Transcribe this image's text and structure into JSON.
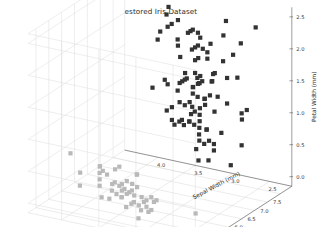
{
  "figure": {
    "title": "Restored Iris Dataset",
    "background_color": "#ffffff",
    "grid_color": "#d8d8d8",
    "axis_color": "#5a5a5a",
    "width": 317,
    "height": 227
  },
  "chart_data": {
    "type": "scatter",
    "projection": "3d",
    "title": "Restored Iris Dataset",
    "xlabel": "Sepal Length (mm)",
    "ylabel": "Sepal Width (mm)",
    "zlabel": "Petal Width (mm)",
    "xticks": [
      4.5,
      5.0,
      5.5,
      6.0,
      6.5,
      7.0,
      7.5
    ],
    "yticks": [
      2.5,
      3.0,
      3.5,
      4.0
    ],
    "zticks": [
      0.0,
      0.5,
      1.0,
      1.5,
      2.0,
      2.5
    ],
    "xlim": [
      4.2,
      7.95
    ],
    "ylim": [
      2.2,
      4.45
    ],
    "zlim": [
      -0.15,
      2.65
    ],
    "grid": true,
    "legend": null,
    "marker": "square",
    "marker_size": 2.1,
    "marker_color": "#333333",
    "x": [
      5.1,
      4.9,
      4.7,
      4.6,
      5.0,
      5.4,
      4.6,
      5.0,
      4.4,
      4.9,
      5.4,
      4.8,
      4.8,
      4.3,
      5.8,
      5.7,
      5.4,
      5.1,
      5.7,
      5.1,
      5.4,
      5.1,
      4.6,
      5.1,
      4.8,
      5.0,
      5.0,
      5.2,
      5.2,
      4.7,
      4.8,
      5.4,
      5.2,
      5.5,
      4.9,
      5.0,
      5.5,
      4.9,
      4.4,
      5.1,
      5.0,
      4.5,
      4.4,
      5.0,
      5.1,
      4.8,
      5.1,
      4.6,
      5.3,
      5.0,
      7.0,
      6.4,
      6.9,
      5.5,
      6.5,
      5.7,
      6.3,
      4.9,
      6.6,
      5.2,
      5.0,
      5.9,
      6.0,
      6.1,
      5.6,
      6.7,
      5.6,
      5.8,
      6.2,
      5.6,
      5.9,
      6.1,
      6.3,
      6.1,
      6.4,
      6.6,
      6.8,
      6.7,
      6.0,
      5.7,
      5.5,
      5.5,
      5.8,
      6.0,
      5.4,
      6.0,
      6.7,
      6.3,
      5.6,
      5.5,
      5.5,
      6.1,
      5.8,
      5.0,
      5.6,
      5.7,
      5.7,
      6.2,
      5.1,
      5.7,
      6.3,
      5.8,
      7.1,
      6.3,
      6.5,
      7.6,
      4.9,
      7.3,
      6.7,
      7.2,
      6.5,
      6.4,
      6.8,
      5.7,
      5.8,
      6.4,
      6.5,
      7.7,
      7.7,
      6.0,
      6.9,
      5.6,
      7.7,
      6.3,
      6.7,
      7.2,
      6.2,
      6.1,
      6.4,
      7.2,
      7.4,
      7.9,
      6.4,
      6.3,
      6.1,
      7.7,
      6.3,
      6.4,
      6.0,
      6.9,
      6.7,
      6.9,
      5.8,
      6.8,
      6.7,
      6.7,
      6.3,
      6.5,
      6.2,
      5.9
    ],
    "y": [
      3.5,
      3.0,
      3.2,
      3.1,
      3.6,
      3.9,
      3.4,
      3.4,
      2.9,
      3.1,
      3.7,
      3.4,
      3.0,
      3.0,
      4.0,
      4.4,
      3.9,
      3.5,
      3.8,
      3.8,
      3.4,
      3.7,
      3.6,
      3.3,
      3.4,
      3.0,
      3.4,
      3.5,
      3.4,
      3.2,
      3.1,
      3.4,
      4.1,
      4.2,
      3.1,
      3.2,
      3.5,
      3.6,
      3.0,
      3.4,
      3.5,
      2.3,
      3.2,
      3.5,
      3.8,
      3.0,
      3.8,
      3.2,
      3.7,
      3.3,
      3.2,
      3.2,
      3.1,
      2.3,
      2.8,
      2.8,
      3.3,
      2.4,
      2.9,
      2.7,
      2.0,
      3.0,
      2.2,
      2.9,
      2.9,
      3.1,
      3.0,
      2.7,
      2.2,
      2.5,
      3.2,
      2.8,
      2.5,
      2.8,
      2.9,
      3.0,
      2.8,
      3.0,
      2.9,
      2.6,
      2.4,
      2.4,
      2.7,
      2.7,
      3.0,
      3.4,
      3.1,
      2.3,
      3.0,
      2.5,
      2.6,
      3.0,
      2.6,
      2.3,
      2.7,
      3.0,
      2.9,
      2.9,
      2.5,
      2.8,
      3.3,
      2.7,
      3.0,
      2.9,
      3.0,
      3.0,
      2.5,
      2.9,
      2.5,
      3.6,
      3.2,
      2.7,
      3.0,
      2.5,
      2.8,
      3.2,
      3.0,
      3.8,
      2.6,
      2.2,
      3.2,
      2.8,
      2.8,
      2.7,
      3.3,
      3.2,
      2.8,
      3.0,
      2.8,
      3.0,
      2.8,
      3.8,
      2.8,
      2.8,
      2.6,
      3.0,
      3.4,
      3.1,
      3.0,
      3.1,
      3.1,
      3.1,
      2.7,
      3.2,
      3.3,
      3.0,
      2.5,
      3.0,
      3.4,
      3.0
    ],
    "z": [
      0.2,
      0.2,
      0.2,
      0.2,
      0.2,
      0.4,
      0.3,
      0.2,
      0.2,
      0.1,
      0.2,
      0.2,
      0.1,
      0.1,
      0.2,
      0.4,
      0.4,
      0.3,
      0.3,
      0.3,
      0.2,
      0.4,
      0.2,
      0.5,
      0.2,
      0.2,
      0.4,
      0.2,
      0.2,
      0.2,
      0.2,
      0.4,
      0.1,
      0.2,
      0.2,
      0.2,
      0.2,
      0.1,
      0.2,
      0.2,
      0.3,
      0.3,
      0.2,
      0.6,
      0.4,
      0.3,
      0.2,
      0.2,
      0.2,
      0.2,
      1.4,
      1.5,
      1.5,
      1.3,
      1.5,
      1.3,
      1.6,
      1.0,
      1.3,
      1.4,
      1.0,
      1.5,
      1.0,
      1.4,
      1.3,
      1.4,
      1.5,
      1.0,
      1.5,
      1.1,
      1.8,
      1.3,
      1.5,
      1.2,
      1.3,
      1.4,
      1.4,
      1.7,
      1.5,
      1.0,
      1.1,
      1.0,
      1.2,
      1.6,
      1.5,
      1.6,
      1.5,
      1.3,
      1.3,
      1.3,
      1.2,
      1.4,
      1.2,
      1.0,
      1.3,
      1.2,
      1.3,
      1.3,
      1.1,
      1.3,
      2.5,
      1.9,
      2.1,
      1.8,
      2.2,
      2.1,
      1.7,
      1.8,
      1.8,
      2.5,
      2.0,
      1.9,
      2.1,
      2.0,
      2.4,
      2.3,
      1.8,
      2.2,
      2.3,
      1.5,
      2.3,
      2.0,
      2.0,
      1.8,
      2.1,
      1.8,
      1.8,
      1.8,
      2.1,
      1.6,
      1.9,
      2.0,
      2.2,
      1.5,
      1.4,
      2.3,
      2.4,
      1.8,
      1.8,
      2.1,
      2.4,
      2.3,
      1.9,
      2.3,
      2.5,
      2.3,
      1.9,
      2.0,
      2.3,
      1.8
    ]
  }
}
